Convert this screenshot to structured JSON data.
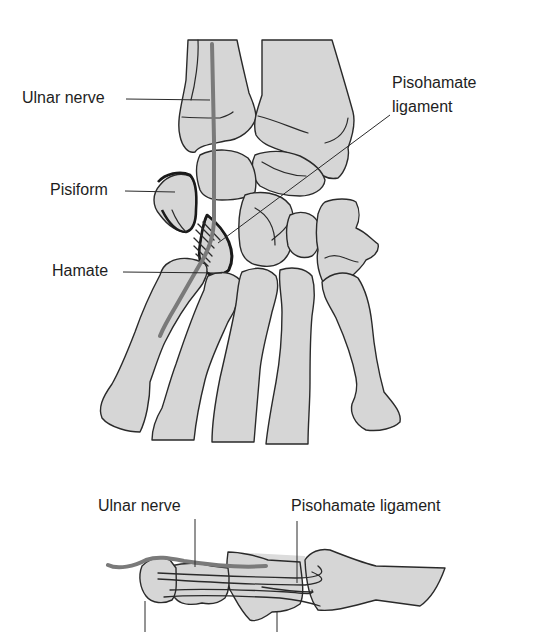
{
  "figure": {
    "colors": {
      "bone_fill": "#d6d6d6",
      "outline": "#2a2a2a",
      "nerve": "#7a7a7a",
      "background": "#ffffff"
    },
    "dorsal_view": {
      "labels": {
        "ulnar_nerve": "Ulnar nerve",
        "pisohamate_line1": "Pisohamate",
        "pisohamate_line2": "ligament",
        "pisiform": "Pisiform",
        "hamate": "Hamate"
      }
    },
    "lateral_view": {
      "labels": {
        "ulnar_nerve": "Ulnar nerve",
        "pisohamate_ligament": "Pisohamate ligament"
      }
    }
  }
}
